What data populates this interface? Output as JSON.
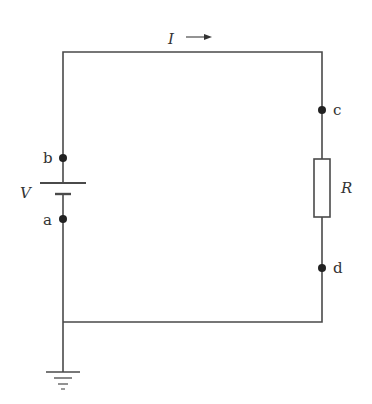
{
  "diagram": {
    "type": "circuit",
    "current": {
      "label": "I",
      "arrow": "→"
    },
    "source": {
      "label": "V",
      "kind": "battery"
    },
    "resistor": {
      "label": "R"
    },
    "nodes": {
      "a": "a",
      "b": "b",
      "c": "c",
      "d": "d"
    },
    "ground": {
      "kind": "ground-symbol"
    }
  },
  "colors": {
    "wire": "#4a4a4a",
    "node": "#222222",
    "text": "#333333",
    "background": "#ffffff"
  }
}
